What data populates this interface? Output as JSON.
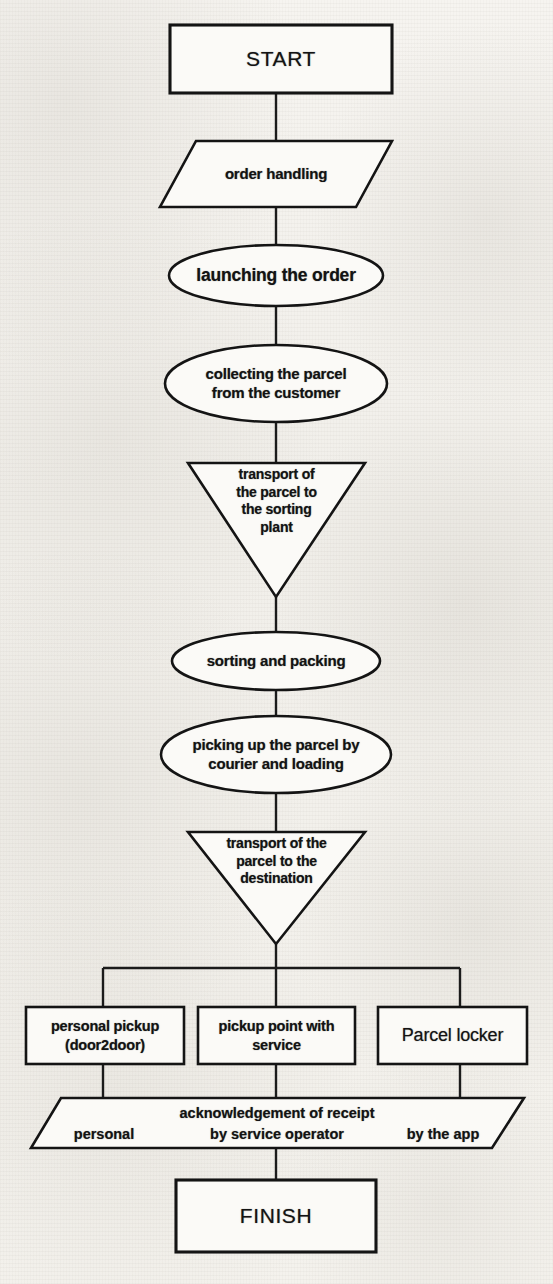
{
  "diagram": {
    "ink_color": "#141414",
    "paper_color": "#f4f2ee"
  },
  "nodes": {
    "start": {
      "shape": "rectangle",
      "label": "START"
    },
    "order_handling": {
      "shape": "parallelogram",
      "label": "order handling"
    },
    "launching": {
      "shape": "ellipse",
      "label": "launching the order"
    },
    "collecting": {
      "shape": "ellipse",
      "line1": "collecting the parcel",
      "line2": "from the customer"
    },
    "transport_sorting": {
      "shape": "inverted-triangle",
      "line1": "transport of",
      "line2": "the parcel to",
      "line3": "the sorting",
      "line4": "plant"
    },
    "sorting_packing": {
      "shape": "ellipse",
      "label": "sorting and packing"
    },
    "picking_up": {
      "shape": "ellipse",
      "line1": "picking up the parcel by",
      "line2": "courier and loading"
    },
    "transport_destination": {
      "shape": "inverted-triangle",
      "line1": "transport of the",
      "line2": "parcel to the",
      "line3": "destination"
    },
    "personal_pickup": {
      "shape": "rectangle",
      "line1": "personal pickup",
      "line2": "(door2door)"
    },
    "pickup_point": {
      "shape": "rectangle",
      "line1": "pickup point with",
      "line2": "service"
    },
    "parcel_locker": {
      "shape": "rectangle",
      "label": "Parcel locker"
    },
    "acknowledgement": {
      "shape": "parallelogram",
      "heading": "acknowledgement of receipt",
      "option_left": "personal",
      "option_center": "by service operator",
      "option_right": "by the app"
    },
    "finish": {
      "shape": "rectangle",
      "label": "FINISH"
    }
  }
}
